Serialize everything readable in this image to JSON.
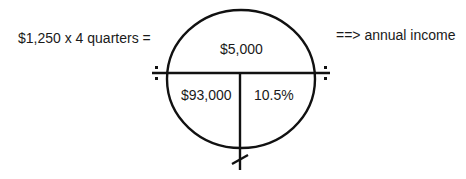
{
  "diagram": {
    "left_equation": "$1,250 x 4 quarters =",
    "right_note": "==> annual income",
    "circle": {
      "top": "$5,000",
      "bottom_left": "$93,000",
      "bottom_right": "10.5%"
    },
    "symbols": {
      "left_divide": "divide-sign",
      "right_divide": "divide-sign",
      "bottom_tick": "slash-mark"
    }
  }
}
